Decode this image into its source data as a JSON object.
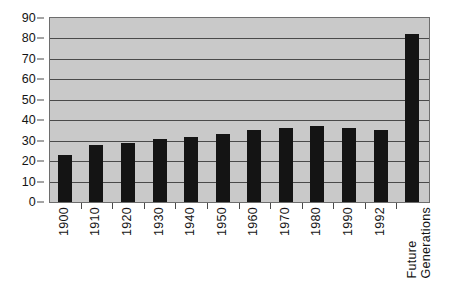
{
  "chart_data": {
    "type": "bar",
    "title": "",
    "subtitle": "",
    "xlabel": "",
    "ylabel": "",
    "categories": [
      "1900",
      "1910",
      "1920",
      "1930",
      "1940",
      "1950",
      "1960",
      "1970",
      "1980",
      "1990",
      "1992",
      "Future\nGenerations"
    ],
    "values": [
      23,
      28,
      29,
      31,
      32,
      33.5,
      35,
      36,
      37,
      36,
      35,
      82
    ],
    "ylim": [
      0,
      90
    ],
    "ytick_labels": [
      "90",
      "80",
      "70",
      "60",
      "50",
      "40",
      "30",
      "20",
      "10",
      "0"
    ],
    "ytick_values": [
      90,
      80,
      70,
      60,
      50,
      40,
      30,
      20,
      10,
      0
    ],
    "ytick_step": 10,
    "grid": true,
    "grid_axis": "y",
    "legend": false,
    "legend_position": "none",
    "bar_color": "#141414",
    "plot_background_color": "#c9c9c9",
    "axis_color": "#4a4a4a",
    "figure_background_color": "#ffffff"
  }
}
